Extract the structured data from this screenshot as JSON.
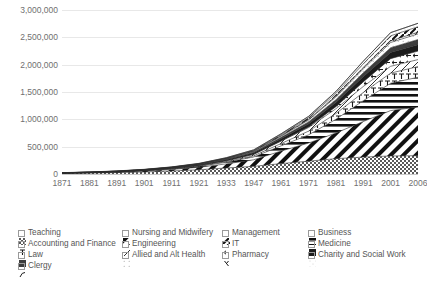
{
  "chart_data": {
    "type": "area",
    "title": "",
    "subtitle": "",
    "xlabel": "",
    "ylabel": "",
    "stacked": true,
    "grid": true,
    "legend_position": "bottom",
    "ylim": [
      0,
      3000000
    ],
    "y_ticks": [
      "0",
      "500,000",
      "1,000,000",
      "1,500,000",
      "2,000,000",
      "2,500,000",
      "3,000,000"
    ],
    "y_tick_values": [
      0,
      500000,
      1000000,
      1500000,
      2000000,
      2500000,
      3000000
    ],
    "categories": [
      "1871",
      "1881",
      "1891",
      "1901",
      "1911",
      "1921",
      "1933",
      "1947",
      "1961",
      "1971",
      "1981",
      "1991",
      "2001",
      "2006"
    ],
    "x_tick_labels": [
      "1871",
      "1881",
      "1891",
      "1901",
      "1911",
      "1921",
      "1933",
      "1947",
      "1961",
      "1971",
      "1981",
      "1991",
      "2001",
      "2006"
    ],
    "series": [
      {
        "name": "Teaching",
        "pattern": "checker-dark",
        "values": [
          12000,
          18000,
          26000,
          38000,
          55000,
          78000,
          110000,
          140000,
          190000,
          235000,
          280000,
          310000,
          330000,
          335000
        ]
      },
      {
        "name": "Nursing and Midwifery",
        "pattern": "diagonal-stripe",
        "values": [
          3000,
          5000,
          9000,
          16000,
          28000,
          45000,
          75000,
          120000,
          230000,
          330000,
          470000,
          650000,
          830000,
          890000
        ]
      },
      {
        "name": "Business",
        "pattern": "horizontal-stripe",
        "values": [
          1000,
          2000,
          3500,
          6000,
          10000,
          17000,
          30000,
          52000,
          95000,
          150000,
          250000,
          380000,
          500000,
          545000
        ]
      },
      {
        "name": "Accounting and Finance",
        "pattern": "tee-mark",
        "values": [
          500,
          900,
          1600,
          2800,
          4500,
          7500,
          13000,
          22000,
          42000,
          68000,
          105000,
          150000,
          185000,
          195000
        ]
      },
      {
        "name": "Engineering",
        "pattern": "sparse-diagonal",
        "values": [
          800,
          1400,
          2400,
          4000,
          6500,
          10000,
          16000,
          26000,
          45000,
          65000,
          88000,
          110000,
          125000,
          128000
        ]
      },
      {
        "name": "IT",
        "pattern": "arrow-mark",
        "values": [
          0,
          0,
          0,
          0,
          0,
          0,
          0,
          500,
          3000,
          12000,
          38000,
          85000,
          140000,
          155000
        ]
      },
      {
        "name": "Medicine",
        "pattern": "solid-dark",
        "values": [
          2000,
          3000,
          4200,
          6000,
          8500,
          12000,
          18000,
          26000,
          40000,
          56000,
          75000,
          95000,
          112000,
          118000
        ]
      },
      {
        "name": "Law",
        "pattern": "solid-mid",
        "values": [
          1500,
          2200,
          3000,
          4200,
          6000,
          8500,
          12000,
          17000,
          26000,
          37000,
          52000,
          70000,
          88000,
          94000
        ]
      },
      {
        "name": "Allied and Alt Health",
        "pattern": "faint-dots",
        "values": [
          300,
          500,
          800,
          1300,
          2200,
          3800,
          6500,
          11000,
          20000,
          32000,
          50000,
          72000,
          95000,
          102000
        ]
      },
      {
        "name": "Pharmacy",
        "pattern": "lambda-mark",
        "values": [
          400,
          600,
          900,
          1400,
          2100,
          3000,
          4500,
          6500,
          10000,
          14000,
          19000,
          25000,
          30000,
          32000
        ]
      },
      {
        "name": "Management",
        "pattern": "thick-diagonal",
        "values": [
          200,
          300,
          500,
          900,
          1600,
          2800,
          5000,
          9000,
          17000,
          28000,
          45000,
          68000,
          92000,
          100000
        ]
      },
      {
        "name": "Charity and Social Work",
        "pattern": "light-dots",
        "values": [
          600,
          900,
          1300,
          1900,
          2800,
          4200,
          6500,
          10000,
          16000,
          24000,
          34000,
          46000,
          58000,
          62000
        ]
      },
      {
        "name": "Clergy",
        "pattern": "curve-mark",
        "values": [
          2500,
          2700,
          2900,
          3000,
          3100,
          3000,
          2900,
          2700,
          2500,
          2300,
          2100,
          1900,
          1700,
          1600
        ]
      }
    ]
  },
  "legend": {
    "columns": [
      {
        "items": [
          {
            "label": "Teaching",
            "pattern": "checker-dark"
          },
          {
            "label": "Accounting and Finance",
            "pattern": "tee-mark"
          },
          {
            "label": "Law",
            "pattern": "solid-mid"
          },
          {
            "label": "Clergy",
            "pattern": "curve-mark"
          }
        ]
      },
      {
        "items": [
          {
            "label": "Nursing and Midwifery",
            "pattern": "diagonal-stripe"
          },
          {
            "label": "Engineering",
            "pattern": "sparse-diagonal"
          },
          {
            "label": "Allied and Alt Health",
            "pattern": "faint-dots"
          }
        ]
      },
      {
        "items": [
          {
            "label": "Management",
            "pattern": "thick-diagonal"
          },
          {
            "label": "IT",
            "pattern": "arrow-mark"
          },
          {
            "label": "Pharmacy",
            "pattern": "lambda-mark"
          }
        ]
      },
      {
        "items": [
          {
            "label": "Business",
            "pattern": "horizontal-stripe"
          },
          {
            "label": "Medicine",
            "pattern": "solid-dark"
          },
          {
            "label": "Charity and Social Work",
            "pattern": "light-dots"
          }
        ]
      }
    ]
  },
  "colors": {
    "grid": "#e8e8e8",
    "axis": "#c9c9c9",
    "tick_text": "#707070",
    "legend_text": "#555555",
    "ink": "#2b2b2b",
    "background": "#ffffff"
  }
}
